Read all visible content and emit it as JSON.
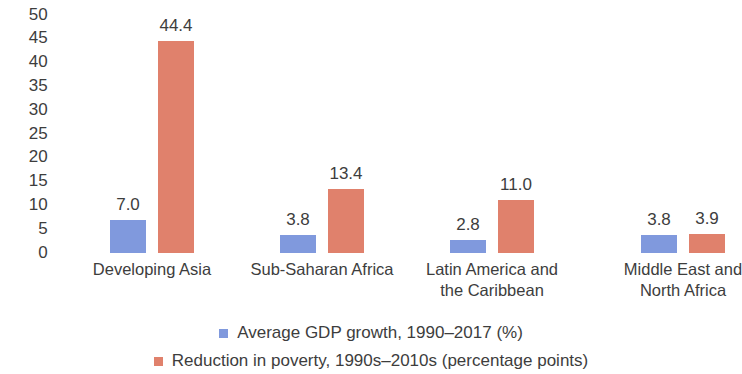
{
  "chart_data": {
    "type": "bar",
    "title": "",
    "xlabel": "",
    "ylabel": "",
    "ylim": [
      0,
      50
    ],
    "ytick_step": 5,
    "grid": false,
    "legend_position": "bottom",
    "categories": [
      "Developing Asia",
      "Sub-Saharan Africa",
      "Latin America and the Caribbean",
      "Middle East and North Africa"
    ],
    "category_lines": [
      [
        "Developing Asia"
      ],
      [
        "Sub-Saharan Africa"
      ],
      [
        "Latin America and",
        "the Caribbean"
      ],
      [
        "Middle East and",
        "North Africa"
      ]
    ],
    "ytick_labels": [
      "50",
      "45",
      "40",
      "35",
      "30",
      "25",
      "20",
      "15",
      "10",
      "5",
      "0"
    ],
    "series": [
      {
        "name": "Average GDP growth, 1990–2017 (%)",
        "color": "#8099dd",
        "values": [
          7.0,
          3.8,
          2.8,
          3.8
        ],
        "labels": [
          "7.0",
          "3.8",
          "2.8",
          "3.8"
        ]
      },
      {
        "name": "Reduction in poverty, 1990s–2010s (percentage points)",
        "color": "#e0816c",
        "values": [
          44.4,
          13.4,
          11.0,
          3.9
        ],
        "labels": [
          "44.4",
          "13.4",
          "11.0",
          "3.9"
        ]
      }
    ]
  },
  "legend": {
    "items": [
      {
        "label": "Average GDP growth, 1990–2017 (%)",
        "color": "#8099dd"
      },
      {
        "label": "Reduction in poverty, 1990s–2010s (percentage points)",
        "color": "#e0816c"
      }
    ]
  }
}
